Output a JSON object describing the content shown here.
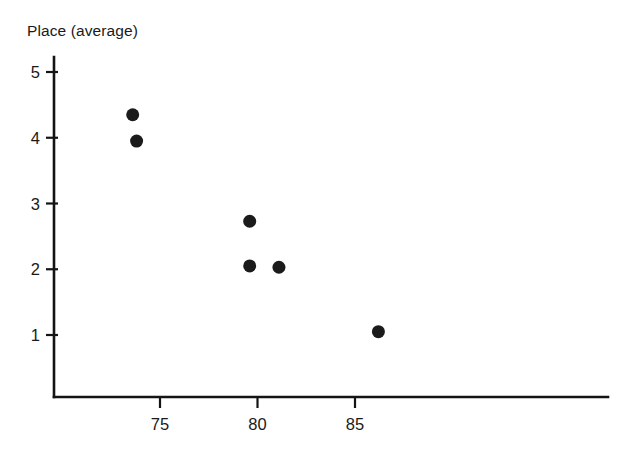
{
  "chart_data": {
    "type": "scatter",
    "title": "Place (average)",
    "xlabel": "",
    "ylabel": "Place (average)",
    "xlim": [
      71.5,
      99
    ],
    "ylim": [
      0.2,
      5.4
    ],
    "grid": false,
    "legend": null,
    "xticks": [
      75,
      80,
      85
    ],
    "xtick_labels": [
      "75",
      "80",
      "85"
    ],
    "yticks": [
      1,
      2,
      3,
      4,
      5
    ],
    "ytick_labels": [
      "1",
      "2",
      "3",
      "4",
      "5"
    ],
    "marker": "filled-circle",
    "marker_color": "#1b1b1b",
    "marker_size_px": 13,
    "points": [
      {
        "x": 73.6,
        "y": 4.35
      },
      {
        "x": 73.8,
        "y": 3.95
      },
      {
        "x": 79.6,
        "y": 2.73
      },
      {
        "x": 79.6,
        "y": 2.05
      },
      {
        "x": 81.1,
        "y": 2.03
      },
      {
        "x": 86.2,
        "y": 1.05
      }
    ],
    "series": [
      {
        "name": "Place (average)",
        "x": [
          73.6,
          73.8,
          79.6,
          79.6,
          81.1,
          86.2
        ],
        "values": [
          4.35,
          3.95,
          2.73,
          2.05,
          2.03,
          1.05
        ]
      }
    ]
  },
  "axes": {
    "axis_color": "#141414",
    "background_color": "#ffffff"
  }
}
